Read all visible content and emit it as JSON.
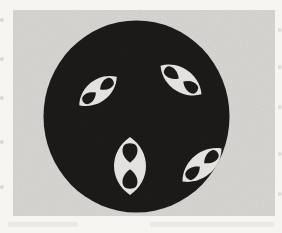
{
  "figure": {
    "colors": {
      "page_white": "#f6f5f2",
      "scan_gray": "#dedcd8",
      "disc_black": "#1d1c1a",
      "lens_white": "#efede9",
      "edge_mark_gray": "#b5b4b0"
    },
    "canvas": {
      "width": 282,
      "height": 233
    },
    "scan_area": {
      "x": 13,
      "y": 10,
      "width": 262,
      "height": 206
    },
    "disc": {
      "cx": 136.5,
      "cy": 116.5,
      "rx": 93,
      "ry": 96
    },
    "lenses": [
      {
        "id": "top-left",
        "cx": 98,
        "cy": 91,
        "a": 23.5,
        "b": 11,
        "angle": -37
      },
      {
        "id": "top-right",
        "cx": 181,
        "cy": 80,
        "a": 25,
        "b": 11.5,
        "angle": 35
      },
      {
        "id": "bottom-center",
        "cx": 130,
        "cy": 166,
        "a": 29,
        "b": 16,
        "angle": 90
      },
      {
        "id": "bottom-right",
        "cx": 202,
        "cy": 165,
        "a": 25.5,
        "b": 11.5,
        "angle": -40
      }
    ],
    "edge_marks": {
      "left_x": 0,
      "left_ys": [
        18,
        57,
        96,
        140,
        185
      ],
      "right_x": 278,
      "right_ys": [
        28,
        65,
        105,
        152,
        192
      ]
    },
    "bottom_ghosts": [
      {
        "x": 8,
        "y": 222,
        "w": 70,
        "h": 5
      },
      {
        "x": 150,
        "y": 222,
        "w": 124,
        "h": 5
      }
    ]
  }
}
